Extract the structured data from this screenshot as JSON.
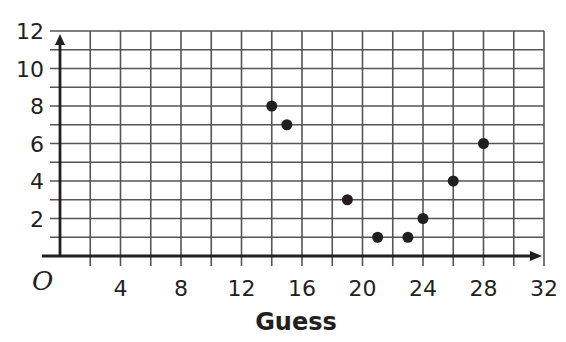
{
  "chart_data": {
    "type": "scatter",
    "title": "",
    "xlabel": "Guess",
    "ylabel": "",
    "origin_label": "O",
    "xlim": [
      0,
      32
    ],
    "ylim": [
      0,
      12
    ],
    "x_ticks": [
      4,
      8,
      12,
      16,
      20,
      24,
      28,
      32
    ],
    "y_ticks": [
      2,
      4,
      6,
      8,
      10,
      12
    ],
    "x_grid_step": 2,
    "y_grid_step": 1,
    "grid": true,
    "points": [
      {
        "x": 14,
        "y": 8
      },
      {
        "x": 15,
        "y": 7
      },
      {
        "x": 19,
        "y": 3
      },
      {
        "x": 21,
        "y": 1
      },
      {
        "x": 23,
        "y": 1
      },
      {
        "x": 24,
        "y": 2
      },
      {
        "x": 26,
        "y": 4
      },
      {
        "x": 28,
        "y": 6
      }
    ],
    "colors": {
      "point": "#231f20",
      "axis": "#231f20",
      "grid": "#555555"
    }
  }
}
